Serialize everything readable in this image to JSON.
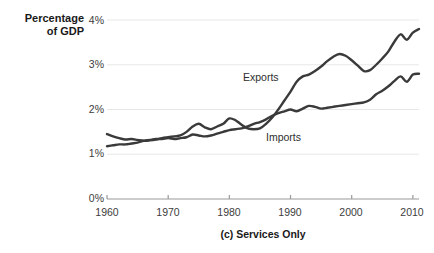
{
  "axis_title": {
    "line1": "Percentage",
    "line2": "of GDP"
  },
  "caption": "(c) Services Only",
  "labels": {
    "exports": "Exports",
    "imports": "Imports"
  },
  "yticks": [
    "0%",
    "1%",
    "2%",
    "3%",
    "4%"
  ],
  "xticks": [
    "1960",
    "1970",
    "1980",
    "1990",
    "2000",
    "2010"
  ],
  "colors": {
    "line": "#3a3a3a",
    "grid": "#e8e8e8",
    "axis": "#9a9a9a",
    "text": "#3c3c3c",
    "background": "#ffffff"
  },
  "chart_data": {
    "type": "line",
    "title": "(c) Services Only",
    "xlabel": "",
    "ylabel": "Percentage of GDP",
    "xlim": [
      1960,
      2011
    ],
    "ylim": [
      0,
      4
    ],
    "ytick_values": [
      0,
      1,
      2,
      3,
      4
    ],
    "xtick_values": [
      1960,
      1970,
      1980,
      1990,
      2000,
      2010
    ],
    "grid": "horizontal",
    "legend": "inline-annotations",
    "x": [
      1960,
      1961,
      1962,
      1963,
      1964,
      1965,
      1966,
      1967,
      1968,
      1969,
      1970,
      1971,
      1972,
      1973,
      1974,
      1975,
      1976,
      1977,
      1978,
      1979,
      1980,
      1981,
      1982,
      1983,
      1984,
      1985,
      1986,
      1987,
      1988,
      1989,
      1990,
      1991,
      1992,
      1993,
      1994,
      1995,
      1996,
      1997,
      1998,
      1999,
      2000,
      2001,
      2002,
      2003,
      2004,
      2005,
      2006,
      2007,
      2008,
      2009,
      2010,
      2011
    ],
    "series": [
      {
        "name": "Exports",
        "values": [
          1.45,
          1.4,
          1.36,
          1.33,
          1.34,
          1.32,
          1.3,
          1.31,
          1.33,
          1.36,
          1.38,
          1.4,
          1.42,
          1.5,
          1.62,
          1.68,
          1.6,
          1.56,
          1.62,
          1.68,
          1.8,
          1.76,
          1.66,
          1.58,
          1.56,
          1.58,
          1.68,
          1.82,
          2.0,
          2.2,
          2.4,
          2.62,
          2.74,
          2.78,
          2.86,
          2.96,
          3.08,
          3.18,
          3.24,
          3.2,
          3.1,
          2.98,
          2.86,
          2.88,
          3.0,
          3.14,
          3.3,
          3.52,
          3.68,
          3.56,
          3.72,
          3.8
        ]
      },
      {
        "name": "Imports",
        "values": [
          1.18,
          1.2,
          1.22,
          1.22,
          1.24,
          1.26,
          1.3,
          1.32,
          1.34,
          1.34,
          1.36,
          1.34,
          1.36,
          1.38,
          1.44,
          1.42,
          1.4,
          1.42,
          1.46,
          1.5,
          1.54,
          1.56,
          1.58,
          1.62,
          1.68,
          1.72,
          1.78,
          1.86,
          1.92,
          1.96,
          2.0,
          1.96,
          2.02,
          2.08,
          2.06,
          2.02,
          2.04,
          2.06,
          2.08,
          2.1,
          2.12,
          2.14,
          2.16,
          2.22,
          2.34,
          2.42,
          2.52,
          2.64,
          2.74,
          2.62,
          2.78,
          2.8
        ]
      }
    ]
  }
}
